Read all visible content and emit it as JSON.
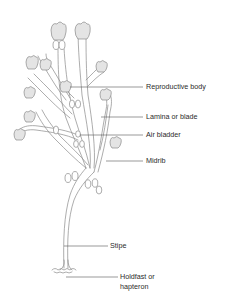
{
  "diagram": {
    "colors": {
      "line": "#8a8a8a",
      "tip_fill": "#e4e4e4",
      "label_text": "#2b2b2b",
      "leader": "#555555",
      "background": "#ffffff"
    },
    "labels": [
      {
        "id": "reproductive-body",
        "text": "Reproductive body",
        "x": 146,
        "y": 83,
        "line_from_x": 70,
        "line_y": 87
      },
      {
        "id": "lamina-or-blade",
        "text": "Lamina or blade",
        "x": 146,
        "y": 113,
        "line_from_x": 101,
        "line_y": 117
      },
      {
        "id": "air-bladder",
        "text": "Air bladder",
        "x": 146,
        "y": 131,
        "line_from_x": 80,
        "line_y": 135
      },
      {
        "id": "midrib",
        "text": "Midrib",
        "x": 146,
        "y": 156,
        "line_from_x": 106,
        "line_y": 160
      },
      {
        "id": "stipe",
        "text": "Stipe",
        "x": 110,
        "y": 240,
        "line_from_x": 63,
        "line_y": 244
      },
      {
        "id": "holdfast",
        "text": "Holdfast or",
        "text2": "hapteron",
        "x": 120,
        "y": 273,
        "line_from_x": 66,
        "line_y": 277
      }
    ]
  }
}
